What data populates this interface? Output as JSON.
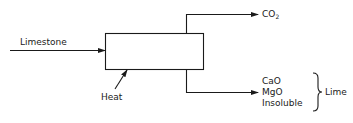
{
  "diagram": {
    "type": "process-flow",
    "process_box": {
      "label": ""
    },
    "inputs": {
      "limestone": "Limestone",
      "heat": "Heat"
    },
    "outputs": {
      "gas": {
        "label": "CO",
        "subscript": "2"
      },
      "solids": [
        "CaO",
        "MgO",
        "Insoluble"
      ],
      "solids_group_label": "Lime"
    },
    "colors": {
      "line": "#1a1a1a",
      "background": "#ffffff"
    }
  }
}
